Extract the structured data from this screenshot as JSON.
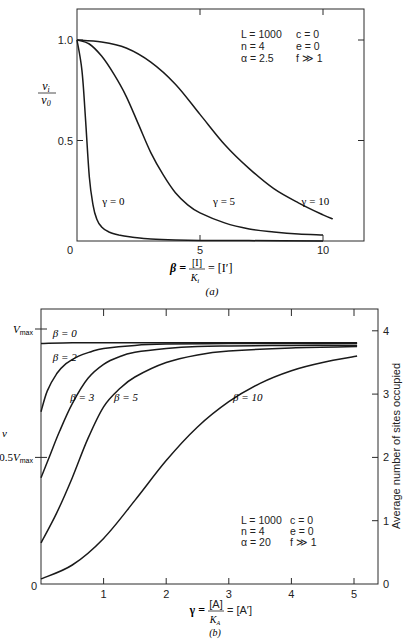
{
  "chart_data": [
    {
      "id": "a",
      "type": "line",
      "caption": "(a)",
      "xlabel": "β = [I]/K_i = [I′]",
      "xlabel_parts": {
        "lhs": "β =",
        "num": "[I]",
        "den": "K",
        "den_sub": "i",
        "rhs": "= [I′]"
      },
      "ylabel_num": "v",
      "ylabel_num_sub": "i",
      "ylabel_den": "v",
      "ylabel_den_sub": "0",
      "xlim": [
        0,
        11.7
      ],
      "ylim": [
        0,
        1.16
      ],
      "xticks": [
        0,
        5,
        10
      ],
      "xtick_labels": [
        "0",
        "5",
        "10"
      ],
      "yticks": [
        0,
        0.5,
        1.0
      ],
      "ytick_labels": [
        "0",
        "0.5",
        "1.0"
      ],
      "grid": false,
      "parameters": [
        [
          "L = 1000",
          "c = 0"
        ],
        [
          "n = 4",
          "e = 0"
        ],
        [
          "α = 2.5",
          "f ≫ 1"
        ]
      ],
      "series": [
        {
          "name": "γ = 0",
          "x": [
            0,
            0.2,
            0.35,
            0.5,
            0.65,
            0.8,
            1.0,
            1.3,
            1.7,
            2.2,
            3,
            4,
            5,
            7,
            10
          ],
          "values": [
            1.0,
            0.85,
            0.6,
            0.32,
            0.18,
            0.11,
            0.07,
            0.045,
            0.03,
            0.02,
            0.01,
            0.005,
            0.003,
            0.002,
            0.0
          ]
        },
        {
          "name": "γ = 5",
          "x": [
            0,
            0.5,
            1,
            1.5,
            2,
            2.5,
            3,
            3.5,
            4,
            4.5,
            5,
            6,
            7,
            8,
            9,
            10
          ],
          "values": [
            1.0,
            0.98,
            0.92,
            0.83,
            0.72,
            0.58,
            0.44,
            0.33,
            0.24,
            0.18,
            0.14,
            0.09,
            0.06,
            0.045,
            0.035,
            0.03
          ]
        },
        {
          "name": "γ = 10",
          "x": [
            0,
            1,
            2,
            3,
            4,
            5,
            6,
            7,
            8,
            9,
            10,
            10.4
          ],
          "values": [
            1.0,
            0.99,
            0.96,
            0.89,
            0.78,
            0.63,
            0.48,
            0.36,
            0.26,
            0.19,
            0.13,
            0.11
          ]
        }
      ],
      "labels": [
        {
          "text": "γ = 0",
          "x": 1.6,
          "y": 0.2
        },
        {
          "text": "γ = 5",
          "x": 6.1,
          "y": 0.2
        },
        {
          "text": "γ = 10",
          "x": 9.7,
          "y": 0.2
        }
      ]
    },
    {
      "id": "b",
      "type": "line",
      "caption": "(b)",
      "xlabel": "γ = [A]/K_A = [A′]",
      "xlabel_parts": {
        "lhs": "γ =",
        "num": "[A]",
        "den": "K",
        "den_sub": "A",
        "rhs": "= [A′]"
      },
      "ylabel": "v",
      "ylabel_right": "Average number of sites occupied",
      "xlim": [
        0,
        5.3
      ],
      "ylim_right": [
        0,
        4.3
      ],
      "xticks": [
        0,
        1,
        2,
        3,
        4,
        5
      ],
      "xtick_labels": [
        "0",
        "1",
        "2",
        "3",
        "4",
        "5"
      ],
      "yticks_left_labels": [
        "0",
        "0.5V_max",
        "V_max"
      ],
      "yticks_left": [
        {
          "label": "0",
          "sites": 0
        },
        {
          "label": "0.5",
          "sub": "max",
          "prefix": "V",
          "sites": 2
        },
        {
          "label": "",
          "sub": "max",
          "prefix": "V",
          "sites": 4
        }
      ],
      "yticks_right": [
        0,
        1,
        2,
        3,
        4
      ],
      "ytick_right_labels": [
        "0",
        "1",
        "2",
        "3",
        "4"
      ],
      "grid": false,
      "parameters": [
        [
          "L = 1000",
          "c = 0"
        ],
        [
          "n = 4",
          "e = 0"
        ],
        [
          "α = 20",
          "f ≫ 1"
        ]
      ],
      "series": [
        {
          "name": "β = 0",
          "x": [
            0,
            0.5,
            1,
            2,
            3,
            4,
            5.05
          ],
          "values": [
            3.8,
            3.81,
            3.81,
            3.81,
            3.81,
            3.81,
            3.81
          ]
        },
        {
          "name": "β = 2",
          "x": [
            0,
            0.1,
            0.25,
            0.4,
            0.6,
            0.8,
            1.0,
            1.5,
            2,
            3,
            4,
            5.05
          ],
          "values": [
            2.72,
            3.05,
            3.32,
            3.48,
            3.6,
            3.67,
            3.72,
            3.77,
            3.79,
            3.8,
            3.8,
            3.8
          ]
        },
        {
          "name": "β = 3",
          "x": [
            0,
            0.15,
            0.3,
            0.5,
            0.75,
            1.0,
            1.25,
            1.5,
            2,
            2.5,
            3,
            4,
            5.05
          ],
          "values": [
            1.68,
            2.05,
            2.42,
            2.85,
            3.25,
            3.47,
            3.59,
            3.66,
            3.72,
            3.75,
            3.76,
            3.77,
            3.77
          ]
        },
        {
          "name": "β = 5",
          "x": [
            0,
            0.25,
            0.5,
            0.75,
            1.0,
            1.25,
            1.5,
            2,
            2.5,
            3,
            4,
            5.05
          ],
          "values": [
            0.65,
            1.12,
            1.68,
            2.3,
            2.8,
            3.08,
            3.27,
            3.5,
            3.62,
            3.68,
            3.73,
            3.75
          ]
        },
        {
          "name": "β = 10",
          "x": [
            0,
            0.5,
            1.0,
            1.5,
            2.0,
            2.5,
            3.0,
            3.5,
            4.0,
            4.5,
            5.05
          ],
          "values": [
            0.08,
            0.3,
            0.72,
            1.32,
            1.95,
            2.48,
            2.88,
            3.17,
            3.37,
            3.5,
            3.6
          ]
        }
      ],
      "labels": [
        {
          "text": "β = 0",
          "x": 0.22,
          "y": 3.97
        },
        {
          "text": "β = 2",
          "x": 0.22,
          "y": 3.58
        },
        {
          "text": "β = 3",
          "x": 0.5,
          "y": 2.95
        },
        {
          "text": "β = 5",
          "x": 1.2,
          "y": 2.95
        },
        {
          "text": "β = 10",
          "x": 3.1,
          "y": 2.95
        }
      ]
    }
  ]
}
